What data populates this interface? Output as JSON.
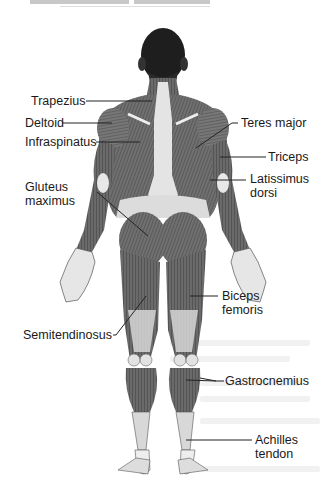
{
  "diagram": {
    "labels_left": [
      {
        "id": "trapezius",
        "text": "Trapezius"
      },
      {
        "id": "deltoid",
        "text": "Deltoid"
      },
      {
        "id": "infraspinatus",
        "text": "Infraspinatus"
      },
      {
        "id": "gluteus-maximus",
        "line1": "Gluteus",
        "line2": "maximus"
      },
      {
        "id": "semitendinosus",
        "text": "Semitendinosus"
      }
    ],
    "labels_right": [
      {
        "id": "teres-major",
        "text": "Teres major"
      },
      {
        "id": "triceps",
        "text": "Triceps"
      },
      {
        "id": "latissimus-dorsi",
        "line1": "Latissimus",
        "line2": "dorsi"
      },
      {
        "id": "biceps-femoris",
        "line1": "Biceps",
        "line2": "femoris"
      },
      {
        "id": "gastrocnemius",
        "text": "Gastrocnemius"
      },
      {
        "id": "achilles-tendon",
        "line1": "Achilles",
        "line2": "tendon"
      }
    ],
    "colors": {
      "muscle": "#6e6e6e",
      "muscle_dark": "#4a4a4a",
      "tendon": "#d8d8d8",
      "skin": "#e6e6e6",
      "hair": "#1e1e1e",
      "leader": "#222222"
    }
  }
}
